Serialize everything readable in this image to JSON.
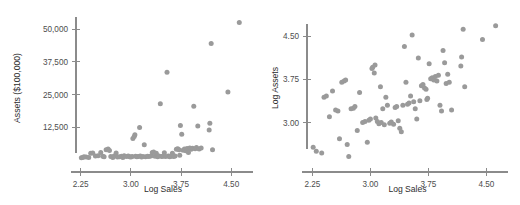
{
  "figure": {
    "background": "#ffffff",
    "point_color": "#9a9a9a",
    "axis_color": "#8b8b8b",
    "text_color": "#2e2e2e"
  },
  "chart_data": [
    {
      "type": "scatter",
      "panel": "left",
      "title": "",
      "xlabel": "Log Sales",
      "ylabel": "Assets ($100,000)",
      "xlim": [
        2.18,
        4.78
      ],
      "ylim": [
        0,
        55000
      ],
      "xticks": [
        2.25,
        3.0,
        3.75,
        4.5
      ],
      "xticklabels": [
        "2.25",
        "3.00",
        "3.75",
        "4.50"
      ],
      "yticks": [
        12500,
        25000,
        37500,
        50000
      ],
      "yticklabels": [
        "12,500",
        "25,000",
        "37,500",
        "50,000"
      ],
      "grid": false,
      "legend": false,
      "points": [
        [
          2.26,
          900
        ],
        [
          2.28,
          1000
        ],
        [
          2.3,
          1200
        ],
        [
          2.33,
          1100
        ],
        [
          2.37,
          1000
        ],
        [
          2.4,
          2600
        ],
        [
          2.43,
          2700
        ],
        [
          2.47,
          1500
        ],
        [
          2.51,
          1600
        ],
        [
          2.55,
          2900
        ],
        [
          2.58,
          1400
        ],
        [
          2.6,
          1200
        ],
        [
          2.63,
          3900
        ],
        [
          2.66,
          4200
        ],
        [
          2.68,
          3600
        ],
        [
          2.7,
          1300
        ],
        [
          2.73,
          1000
        ],
        [
          2.75,
          1500
        ],
        [
          2.78,
          2700
        ],
        [
          2.8,
          1100
        ],
        [
          2.83,
          1200
        ],
        [
          2.86,
          1400
        ],
        [
          2.88,
          1000
        ],
        [
          2.9,
          1600
        ],
        [
          2.93,
          1300
        ],
        [
          2.96,
          1500
        ],
        [
          2.98,
          1200
        ],
        [
          3.0,
          1100
        ],
        [
          3.02,
          1300
        ],
        [
          3.03,
          8200
        ],
        [
          3.05,
          9000
        ],
        [
          3.06,
          9600
        ],
        [
          3.07,
          1400
        ],
        [
          3.09,
          1200
        ],
        [
          3.11,
          1300
        ],
        [
          3.13,
          12400
        ],
        [
          3.14,
          1500
        ],
        [
          3.16,
          1100
        ],
        [
          3.18,
          1300
        ],
        [
          3.2,
          5800
        ],
        [
          3.22,
          1200
        ],
        [
          3.25,
          1400
        ],
        [
          3.27,
          1300
        ],
        [
          3.3,
          1500
        ],
        [
          3.32,
          2900
        ],
        [
          3.34,
          3100
        ],
        [
          3.36,
          1400
        ],
        [
          3.38,
          2600
        ],
        [
          3.4,
          1200
        ],
        [
          3.42,
          1500
        ],
        [
          3.44,
          21500
        ],
        [
          3.46,
          1300
        ],
        [
          3.48,
          1400
        ],
        [
          3.5,
          2800
        ],
        [
          3.52,
          1300
        ],
        [
          3.54,
          33500
        ],
        [
          3.56,
          1500
        ],
        [
          3.58,
          1200
        ],
        [
          3.6,
          1400
        ],
        [
          3.62,
          2600
        ],
        [
          3.64,
          1300
        ],
        [
          3.66,
          1500
        ],
        [
          3.68,
          4100
        ],
        [
          3.7,
          4300
        ],
        [
          3.72,
          3900
        ],
        [
          3.73,
          1800
        ],
        [
          3.74,
          13200
        ],
        [
          3.76,
          9800
        ],
        [
          3.78,
          3700
        ],
        [
          3.8,
          4200
        ],
        [
          3.82,
          3500
        ],
        [
          3.84,
          4400
        ],
        [
          3.86,
          2900
        ],
        [
          3.88,
          4600
        ],
        [
          3.9,
          4100
        ],
        [
          3.92,
          4500
        ],
        [
          3.94,
          20500
        ],
        [
          3.96,
          4300
        ],
        [
          3.98,
          4800
        ],
        [
          4.0,
          13000
        ],
        [
          4.02,
          4200
        ],
        [
          4.05,
          4600
        ],
        [
          4.17,
          11500
        ],
        [
          4.18,
          14000
        ],
        [
          4.2,
          44500
        ],
        [
          4.22,
          3900
        ],
        [
          4.45,
          26000
        ],
        [
          4.62,
          52500
        ]
      ]
    },
    {
      "type": "scatter",
      "panel": "right",
      "title": "",
      "xlabel": "Log Sales",
      "ylabel": "Log Assets",
      "xlim": [
        2.18,
        4.78
      ],
      "ylim": [
        2.35,
        4.85
      ],
      "xticks": [
        2.25,
        3.0,
        3.75,
        4.5
      ],
      "xticklabels": [
        "2.25",
        "3.00",
        "3.75",
        "4.50"
      ],
      "yticks": [
        3.0,
        3.75,
        4.5
      ],
      "yticklabels": [
        "3.00",
        "3.75",
        "4.50"
      ],
      "grid": false,
      "legend": false,
      "points": [
        [
          2.26,
          2.57
        ],
        [
          2.3,
          2.5
        ],
        [
          2.37,
          2.47
        ],
        [
          2.4,
          3.44
        ],
        [
          2.43,
          3.46
        ],
        [
          2.47,
          3.1
        ],
        [
          2.51,
          3.55
        ],
        [
          2.55,
          3.22
        ],
        [
          2.58,
          3.2
        ],
        [
          2.6,
          2.72
        ],
        [
          2.63,
          3.7
        ],
        [
          2.66,
          3.72
        ],
        [
          2.68,
          3.74
        ],
        [
          2.7,
          2.62
        ],
        [
          2.72,
          2.41
        ],
        [
          2.75,
          3.24
        ],
        [
          2.78,
          3.25
        ],
        [
          2.8,
          3.28
        ],
        [
          2.83,
          2.86
        ],
        [
          2.86,
          3.52
        ],
        [
          2.9,
          3.0
        ],
        [
          2.93,
          3.02
        ],
        [
          2.96,
          2.66
        ],
        [
          2.98,
          3.04
        ],
        [
          3.0,
          3.06
        ],
        [
          3.02,
          3.94
        ],
        [
          3.03,
          3.96
        ],
        [
          3.05,
          3.86
        ],
        [
          3.06,
          4.0
        ],
        [
          3.07,
          3.08
        ],
        [
          3.09,
          3.02
        ],
        [
          3.11,
          2.98
        ],
        [
          3.13,
          3.62
        ],
        [
          3.14,
          3.0
        ],
        [
          3.16,
          3.24
        ],
        [
          3.18,
          2.96
        ],
        [
          3.2,
          3.44
        ],
        [
          3.22,
          3.3
        ],
        [
          3.25,
          2.99
        ],
        [
          3.27,
          3.01
        ],
        [
          3.3,
          2.97
        ],
        [
          3.32,
          3.26
        ],
        [
          3.34,
          3.28
        ],
        [
          3.36,
          3.03
        ],
        [
          3.38,
          2.9
        ],
        [
          3.4,
          2.84
        ],
        [
          3.42,
          3.3
        ],
        [
          3.44,
          4.32
        ],
        [
          3.46,
          3.7
        ],
        [
          3.48,
          3.32
        ],
        [
          3.5,
          3.34
        ],
        [
          3.52,
          3.46
        ],
        [
          3.54,
          4.52
        ],
        [
          3.56,
          3.36
        ],
        [
          3.58,
          3.24
        ],
        [
          3.6,
          3.06
        ],
        [
          3.62,
          4.12
        ],
        [
          3.64,
          3.38
        ],
        [
          3.66,
          3.64
        ],
        [
          3.68,
          3.66
        ],
        [
          3.7,
          3.6
        ],
        [
          3.72,
          3.58
        ],
        [
          3.73,
          3.4
        ],
        [
          3.74,
          3.42
        ],
        [
          3.76,
          4.02
        ],
        [
          3.78,
          3.76
        ],
        [
          3.8,
          3.78
        ],
        [
          3.82,
          3.74
        ],
        [
          3.84,
          3.8
        ],
        [
          3.86,
          3.72
        ],
        [
          3.88,
          3.82
        ],
        [
          3.9,
          3.3
        ],
        [
          3.92,
          3.2
        ],
        [
          3.94,
          4.25
        ],
        [
          3.96,
          4.04
        ],
        [
          3.98,
          3.68
        ],
        [
          4.0,
          3.84
        ],
        [
          4.02,
          3.7
        ],
        [
          4.05,
          3.22
        ],
        [
          4.17,
          3.98
        ],
        [
          4.18,
          4.14
        ],
        [
          4.2,
          4.62
        ],
        [
          4.22,
          3.62
        ],
        [
          4.45,
          4.44
        ],
        [
          4.62,
          4.68
        ]
      ]
    }
  ]
}
